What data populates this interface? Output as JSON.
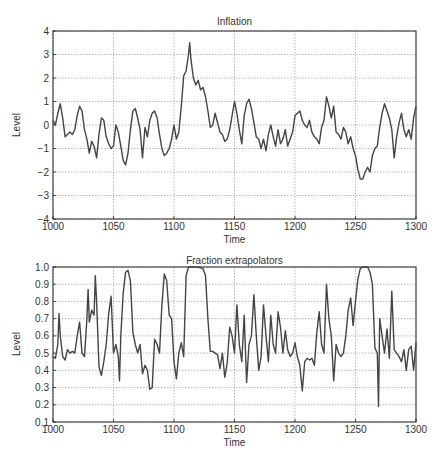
{
  "chart_data": [
    {
      "type": "line",
      "title": "Inflation",
      "xlabel": "Time",
      "ylabel": "Level",
      "xlim": [
        1000,
        1300
      ],
      "ylim": [
        -4,
        4
      ],
      "xticks": [
        1000,
        1050,
        1100,
        1150,
        1200,
        1250,
        1300
      ],
      "yticks": [
        -4,
        -3,
        -2,
        -1,
        0,
        1,
        2,
        3,
        4
      ],
      "ytick_labels": [
        "−4",
        "−3",
        "−2",
        "−1",
        "0",
        "1",
        "2",
        "3",
        "4"
      ],
      "grid": true,
      "legend": null,
      "series": [
        {
          "name": "Inflation",
          "color": "#444444",
          "x": [
            1000,
            1002,
            1004,
            1006,
            1008,
            1010,
            1012,
            1014,
            1016,
            1018,
            1020,
            1022,
            1024,
            1026,
            1028,
            1030,
            1032,
            1034,
            1036,
            1038,
            1040,
            1042,
            1044,
            1046,
            1048,
            1050,
            1052,
            1054,
            1056,
            1058,
            1060,
            1062,
            1064,
            1066,
            1068,
            1070,
            1072,
            1074,
            1076,
            1078,
            1080,
            1082,
            1084,
            1086,
            1088,
            1090,
            1092,
            1094,
            1096,
            1098,
            1100,
            1102,
            1104,
            1106,
            1108,
            1110,
            1112,
            1113,
            1114,
            1116,
            1118,
            1120,
            1122,
            1124,
            1126,
            1128,
            1130,
            1132,
            1134,
            1136,
            1138,
            1140,
            1142,
            1144,
            1146,
            1148,
            1150,
            1152,
            1154,
            1156,
            1158,
            1160,
            1162,
            1164,
            1166,
            1168,
            1170,
            1172,
            1174,
            1176,
            1178,
            1180,
            1182,
            1184,
            1186,
            1188,
            1190,
            1192,
            1194,
            1196,
            1198,
            1200,
            1202,
            1204,
            1206,
            1208,
            1210,
            1212,
            1214,
            1216,
            1218,
            1220,
            1222,
            1224,
            1226,
            1228,
            1230,
            1232,
            1234,
            1236,
            1238,
            1240,
            1242,
            1244,
            1246,
            1248,
            1250,
            1252,
            1254,
            1256,
            1258,
            1260,
            1262,
            1264,
            1266,
            1268,
            1270,
            1272,
            1274,
            1276,
            1278,
            1280,
            1282,
            1284,
            1286,
            1288,
            1290,
            1292,
            1294,
            1296,
            1298,
            1300
          ],
          "y": [
            0.2,
            0.0,
            0.5,
            0.9,
            0.3,
            -0.5,
            -0.4,
            -0.3,
            -0.4,
            -0.2,
            0.4,
            0.8,
            0.6,
            -0.2,
            -0.6,
            -1.2,
            -0.7,
            -0.9,
            -1.4,
            -0.4,
            0.3,
            0.2,
            -0.5,
            -0.8,
            -1.0,
            -0.9,
            0.0,
            -0.3,
            -0.9,
            -1.5,
            -1.7,
            -1.2,
            -0.2,
            0.6,
            0.7,
            0.3,
            -0.2,
            -1.4,
            -0.1,
            -0.5,
            0.2,
            0.5,
            0.6,
            0.3,
            -0.4,
            -1.0,
            -1.3,
            -1.2,
            -1.0,
            -0.6,
            0.0,
            -0.6,
            -0.3,
            0.8,
            2.1,
            2.3,
            3.0,
            3.5,
            2.8,
            2.0,
            1.7,
            1.9,
            1.5,
            1.6,
            1.2,
            0.6,
            -0.1,
            0.0,
            0.5,
            0.1,
            -0.3,
            -0.4,
            -0.7,
            -0.6,
            -0.2,
            0.4,
            1.0,
            0.5,
            -0.2,
            -0.8,
            0.4,
            0.9,
            1.1,
            0.7,
            0.1,
            -0.5,
            -0.6,
            -1.0,
            -0.6,
            -1.1,
            -0.4,
            0.0,
            -0.5,
            -0.9,
            -0.2,
            -0.8,
            -0.6,
            -0.2,
            -0.9,
            -0.6,
            -0.3,
            0.4,
            0.5,
            0.6,
            0.2,
            0.0,
            -0.1,
            0.2,
            -0.3,
            -0.5,
            -0.6,
            -0.8,
            -0.1,
            0.2,
            1.2,
            0.8,
            0.3,
            0.8,
            -0.3,
            -0.4,
            -0.6,
            -0.1,
            -0.3,
            -0.8,
            -0.5,
            -1.0,
            -1.3,
            -1.9,
            -2.3,
            -2.3,
            -2.0,
            -1.8,
            -2.0,
            -1.3,
            -1.0,
            -0.9,
            -0.1,
            0.5,
            0.9,
            0.6,
            0.3,
            -0.2,
            -1.4,
            -0.5,
            0.1,
            0.5,
            -0.2,
            -0.5,
            -0.2,
            -0.6,
            0.3,
            0.8,
            0.5,
            0.4,
            1.5
          ]
        }
      ]
    },
    {
      "type": "line",
      "title": "Fraction extrapolators",
      "xlabel": "Time",
      "ylabel": "Level",
      "xlim": [
        1000,
        1300
      ],
      "ylim": [
        0.1,
        1.0
      ],
      "xticks": [
        1000,
        1050,
        1100,
        1150,
        1200,
        1250,
        1300
      ],
      "yticks": [
        0.1,
        0.2,
        0.3,
        0.4,
        0.5,
        0.6,
        0.7,
        0.8,
        0.9,
        1.0
      ],
      "ytick_labels": [
        "0.1",
        "0.2",
        "0.3",
        "0.4",
        "0.5",
        "0.6",
        "0.7",
        "0.8",
        "0.9",
        "1.0"
      ],
      "grid": true,
      "legend": null,
      "series": [
        {
          "name": "Fraction extrapolators",
          "color": "#444444",
          "x": [
            1000,
            1002,
            1004,
            1005,
            1006,
            1008,
            1010,
            1012,
            1014,
            1016,
            1018,
            1020,
            1022,
            1024,
            1026,
            1028,
            1029,
            1030,
            1032,
            1034,
            1035,
            1036,
            1038,
            1040,
            1042,
            1044,
            1046,
            1048,
            1050,
            1052,
            1054,
            1055,
            1056,
            1058,
            1060,
            1062,
            1064,
            1066,
            1068,
            1070,
            1072,
            1074,
            1076,
            1078,
            1080,
            1082,
            1084,
            1086,
            1088,
            1090,
            1092,
            1094,
            1096,
            1098,
            1100,
            1102,
            1104,
            1106,
            1108,
            1110,
            1112,
            1116,
            1120,
            1124,
            1126,
            1128,
            1130,
            1132,
            1134,
            1136,
            1138,
            1140,
            1142,
            1144,
            1146,
            1148,
            1150,
            1152,
            1154,
            1156,
            1158,
            1160,
            1162,
            1164,
            1166,
            1168,
            1170,
            1172,
            1174,
            1176,
            1178,
            1180,
            1182,
            1184,
            1186,
            1188,
            1190,
            1192,
            1194,
            1196,
            1198,
            1200,
            1202,
            1204,
            1206,
            1208,
            1210,
            1212,
            1214,
            1216,
            1218,
            1220,
            1222,
            1224,
            1226,
            1228,
            1230,
            1232,
            1234,
            1236,
            1238,
            1240,
            1242,
            1244,
            1246,
            1248,
            1250,
            1252,
            1254,
            1256,
            1258,
            1260,
            1262,
            1264,
            1266,
            1268,
            1269,
            1270,
            1272,
            1274,
            1276,
            1278,
            1280,
            1282,
            1284,
            1286,
            1288,
            1290,
            1292,
            1294,
            1296,
            1298,
            1300
          ],
          "y": [
            0.48,
            0.47,
            0.55,
            0.73,
            0.6,
            0.48,
            0.46,
            0.52,
            0.5,
            0.51,
            0.5,
            0.6,
            0.68,
            0.5,
            0.48,
            0.7,
            0.87,
            0.68,
            0.75,
            0.72,
            0.95,
            0.8,
            0.42,
            0.37,
            0.45,
            0.55,
            0.73,
            0.83,
            0.5,
            0.55,
            0.48,
            0.34,
            0.6,
            0.85,
            0.97,
            0.98,
            0.92,
            0.62,
            0.55,
            0.5,
            0.55,
            0.38,
            0.43,
            0.4,
            0.29,
            0.3,
            0.58,
            0.55,
            0.5,
            0.78,
            0.96,
            0.92,
            0.72,
            0.7,
            0.45,
            0.35,
            0.5,
            0.56,
            0.48,
            0.95,
            1.0,
            1.0,
            1.0,
            0.99,
            0.95,
            0.7,
            0.51,
            0.51,
            0.5,
            0.49,
            0.41,
            0.5,
            0.36,
            0.44,
            0.65,
            0.6,
            0.5,
            0.78,
            0.55,
            0.45,
            0.72,
            0.33,
            0.55,
            0.6,
            0.84,
            0.6,
            0.4,
            0.48,
            0.78,
            0.6,
            0.45,
            0.72,
            0.55,
            0.5,
            0.74,
            0.65,
            0.5,
            0.63,
            0.52,
            0.48,
            0.5,
            0.56,
            0.48,
            0.43,
            0.28,
            0.45,
            0.47,
            0.46,
            0.47,
            0.43,
            0.62,
            0.74,
            0.55,
            0.5,
            0.9,
            0.7,
            0.6,
            0.34,
            0.55,
            0.5,
            0.48,
            0.5,
            0.6,
            0.75,
            0.82,
            0.66,
            0.8,
            0.93,
            0.99,
            1.0,
            1.0,
            1.0,
            0.97,
            0.9,
            0.53,
            0.5,
            0.19,
            0.7,
            0.6,
            0.5,
            0.64,
            0.47,
            0.86,
            0.52,
            0.5,
            0.48,
            0.45,
            0.52,
            0.4,
            0.52,
            0.54,
            0.4,
            0.56,
            0.56,
            0.88
          ]
        }
      ]
    }
  ]
}
